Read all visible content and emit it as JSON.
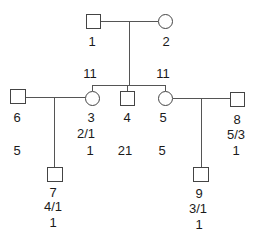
{
  "diagram": {
    "type": "pedigree",
    "individuals": [
      {
        "id": "1",
        "sex": "male",
        "generation": 1,
        "annotations": []
      },
      {
        "id": "2",
        "sex": "female",
        "generation": 1,
        "annotations": []
      },
      {
        "id": "3",
        "sex": "female",
        "generation": 2,
        "annotations": [
          "2/1",
          "1"
        ]
      },
      {
        "id": "4",
        "sex": "male",
        "generation": 2,
        "annotations": [
          "21"
        ]
      },
      {
        "id": "5",
        "sex": "female",
        "generation": 2,
        "annotations": [
          "5"
        ]
      },
      {
        "id": "6",
        "sex": "male",
        "generation": 2,
        "annotations": [
          "5"
        ]
      },
      {
        "id": "7",
        "sex": "male",
        "generation": 3,
        "annotations": [
          "4/1",
          "1"
        ]
      },
      {
        "id": "8",
        "sex": "male",
        "generation": 2,
        "annotations": [
          "5/3",
          "1"
        ]
      },
      {
        "id": "9",
        "sex": "male",
        "generation": 3,
        "annotations": [
          "3/1",
          "1"
        ]
      }
    ],
    "sibship_labels": {
      "left": "11",
      "right": "11"
    },
    "couples": [
      [
        "1",
        "2"
      ],
      [
        "6",
        "3"
      ],
      [
        "5",
        "8"
      ]
    ],
    "children": {
      "1+2": [
        "3",
        "4",
        "5"
      ],
      "6+3": [
        "7"
      ],
      "5+8": [
        "9"
      ]
    }
  },
  "labels": {
    "p1": "1",
    "p2": "2",
    "p3": "3",
    "p4": "4",
    "p5": "5",
    "p6": "6",
    "p7": "7",
    "p8": "8",
    "p9": "9",
    "sib_left": "11",
    "sib_right": "11",
    "p3_a1": "2/1",
    "p3_a2": "1",
    "p4_a1": "21",
    "p5_a1": "5",
    "p6_a1": "5",
    "p7_a1": "4/1",
    "p7_a2": "1",
    "p8_a1": "5/3",
    "p8_a2": "1",
    "p9_a1": "3/1",
    "p9_a2": "1"
  },
  "colors": {
    "line": "#555555",
    "stroke": "#444444",
    "text": "#1a1a1a",
    "background": "#ffffff"
  }
}
